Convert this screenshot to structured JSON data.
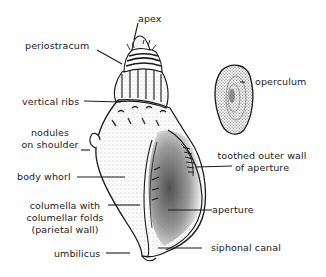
{
  "diagram": {
    "type": "labeled anatomical illustration",
    "colors": {
      "ink": "#1a1a1a",
      "background": "#ffffff",
      "stipple": "#555555"
    },
    "labels": {
      "apex": "apex",
      "periostracum": "periostracum",
      "vertical_ribs": "vertical ribs",
      "nodules_line1": "nodules",
      "nodules_line2": "on shoulder",
      "body_whorl": "body whorl",
      "columella_line1": "columella with",
      "columella_line2": "columellar folds",
      "columella_line3": "(parietal wall)",
      "umbilicus": "umbilicus",
      "operculum": "operculum",
      "toothed_line1": "toothed outer wall",
      "toothed_line2": "of aperture",
      "aperture": "aperture",
      "siphonal_canal": "siphonal canal"
    }
  }
}
